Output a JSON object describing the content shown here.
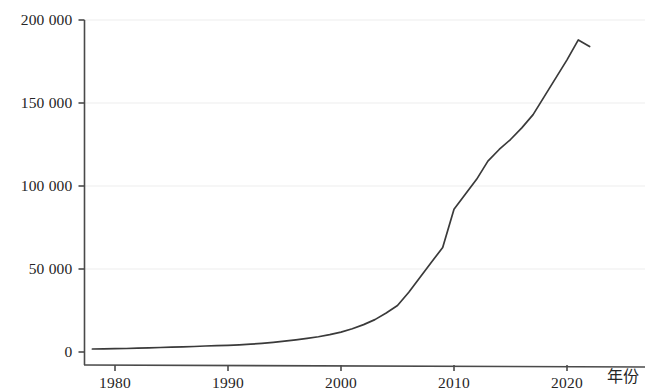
{
  "figure": {
    "background_color": "#ffffff",
    "line_color": "#3a3a3a",
    "axis_color": "#4a4a4a",
    "grid_color": "#ededed"
  },
  "axes": {
    "x_title": "年份",
    "y_title": "",
    "x_ticks": [
      "1980",
      "1990",
      "2000",
      "2010",
      "2020"
    ],
    "y_ticks": [
      "0",
      "50 000",
      "100 000",
      "150 000",
      "200 000"
    ]
  },
  "chart_data": {
    "type": "line",
    "title": "",
    "subtitle": "",
    "xlabel": "年份",
    "ylabel": "",
    "xlim": [
      1977,
      2024
    ],
    "ylim": [
      0,
      200000
    ],
    "xticks": [
      1980,
      1990,
      2000,
      2010,
      2020
    ],
    "xticklabels": [
      "1980",
      "1990",
      "2000",
      "2010",
      "2020"
    ],
    "yticks": [
      0,
      50000,
      100000,
      150000,
      200000
    ],
    "yticklabels": [
      "0",
      "50 000",
      "100 000",
      "150 000",
      "200 000"
    ],
    "grid": "horizontal-only-faint",
    "legend": "none",
    "series": [
      {
        "name": "",
        "x": [
          1978,
          1979,
          1980,
          1981,
          1982,
          1983,
          1984,
          1985,
          1986,
          1987,
          1988,
          1989,
          1990,
          1991,
          1992,
          1993,
          1994,
          1995,
          1996,
          1997,
          1998,
          1999,
          2000,
          2001,
          2002,
          2003,
          2004,
          2005,
          2006,
          2007,
          2008,
          2009,
          2010,
          2011,
          2012,
          2013,
          2014,
          2015,
          2016,
          2017,
          2018,
          2019,
          2020,
          2021,
          2022
        ],
        "values": [
          1800,
          1900,
          2000,
          2100,
          2300,
          2500,
          2700,
          2900,
          3100,
          3300,
          3600,
          3800,
          4000,
          4300,
          4700,
          5200,
          5800,
          6500,
          7300,
          8200,
          9200,
          10500,
          12000,
          14000,
          16500,
          19500,
          23500,
          28000,
          36000,
          45000,
          54000,
          63000,
          86000,
          95000,
          104000,
          115000,
          122000,
          128000,
          135000,
          143000,
          154000,
          165000,
          176000,
          188000,
          184000
        ]
      }
    ]
  }
}
